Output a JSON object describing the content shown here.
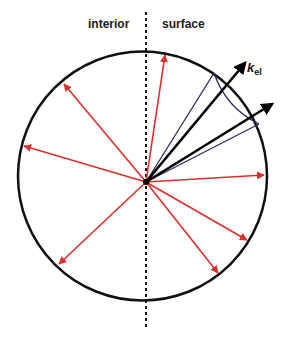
{
  "diagram": {
    "labels": {
      "interior": "interior",
      "surface": "surface",
      "k_symbol": "k",
      "k_subscript": "el"
    },
    "colors": {
      "circle": "#111111",
      "red_arrows": "#d9302c",
      "black_arrows": "#000000",
      "cone_lines": "#2b2d5c",
      "divider": "#111111"
    },
    "elements": {
      "circle": "sphere boundary",
      "divider": "dashed vertical line separating interior and surface",
      "red_arrows_count": 9,
      "black_arrows_count": 2,
      "cone": "escape cone around k_el direction"
    }
  }
}
